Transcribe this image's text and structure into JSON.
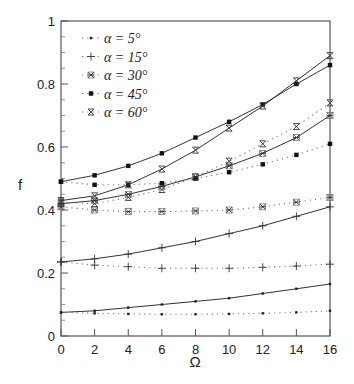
{
  "chart_data": {
    "type": "line",
    "title": "",
    "xlabel": "Ω",
    "ylabel": "f",
    "xlim": [
      0,
      16
    ],
    "ylim": [
      0,
      1
    ],
    "x_ticks": [
      0,
      2,
      4,
      6,
      8,
      10,
      12,
      14,
      16
    ],
    "x_tick_labels": [
      "0",
      "2",
      "4",
      "6",
      "8",
      "10",
      "12",
      "14",
      "16"
    ],
    "y_ticks": [
      0,
      0.2,
      0.4,
      0.6,
      0.8,
      1
    ],
    "y_tick_labels": [
      "0",
      "0.2",
      "0.4",
      "0.6",
      "0.8",
      "1"
    ],
    "grid": false,
    "legend_position": "top-left",
    "legend": [
      {
        "label": "α = 5°",
        "marker": "dot"
      },
      {
        "label": "α = 15°",
        "marker": "plus"
      },
      {
        "label": "α = 30°",
        "marker": "asterisk"
      },
      {
        "label": "α = 45°",
        "marker": "square"
      },
      {
        "label": "α = 60°",
        "marker": "hourglass"
      }
    ],
    "x": [
      0,
      2,
      4,
      6,
      8,
      10,
      12,
      14,
      16
    ],
    "series": [
      {
        "name": "α = 5° (solid)",
        "marker": "dot",
        "style": "solid",
        "values": [
          0.075,
          0.08,
          0.09,
          0.1,
          0.11,
          0.12,
          0.135,
          0.15,
          0.165
        ]
      },
      {
        "name": "α = 5° (dotted)",
        "marker": "dot",
        "style": "dotted",
        "values": [
          0.075,
          0.072,
          0.07,
          0.069,
          0.069,
          0.07,
          0.072,
          0.075,
          0.08
        ]
      },
      {
        "name": "α = 15° (solid)",
        "marker": "plus",
        "style": "solid",
        "values": [
          0.235,
          0.245,
          0.26,
          0.28,
          0.3,
          0.325,
          0.35,
          0.38,
          0.41
        ]
      },
      {
        "name": "α = 15° (dotted)",
        "marker": "plus",
        "style": "dotted",
        "values": [
          0.235,
          0.225,
          0.22,
          0.215,
          0.215,
          0.215,
          0.218,
          0.222,
          0.228
        ]
      },
      {
        "name": "α = 30° (solid)",
        "marker": "asterisk",
        "style": "solid",
        "values": [
          0.42,
          0.43,
          0.45,
          0.475,
          0.505,
          0.54,
          0.58,
          0.63,
          0.7
        ]
      },
      {
        "name": "α = 30° (dotted)",
        "marker": "asterisk",
        "style": "dotted",
        "values": [
          0.41,
          0.4,
          0.395,
          0.395,
          0.397,
          0.4,
          0.41,
          0.425,
          0.44
        ]
      },
      {
        "name": "α = 45° (solid)",
        "marker": "square",
        "style": "solid",
        "values": [
          0.49,
          0.51,
          0.54,
          0.58,
          0.63,
          0.68,
          0.735,
          0.8,
          0.86
        ]
      },
      {
        "name": "α = 45° (dotted)",
        "marker": "square",
        "style": "dotted",
        "values": [
          0.49,
          0.48,
          0.48,
          0.485,
          0.5,
          0.52,
          0.545,
          0.575,
          0.61
        ]
      },
      {
        "name": "α = 60° (solid)",
        "marker": "hourglass",
        "style": "solid",
        "values": [
          0.43,
          0.445,
          0.48,
          0.53,
          0.59,
          0.66,
          0.73,
          0.81,
          0.89
        ]
      },
      {
        "name": "α = 60° (dotted)",
        "marker": "hourglass",
        "style": "dotted",
        "values": [
          0.425,
          0.42,
          0.44,
          0.465,
          0.505,
          0.555,
          0.61,
          0.665,
          0.74
        ]
      }
    ]
  }
}
